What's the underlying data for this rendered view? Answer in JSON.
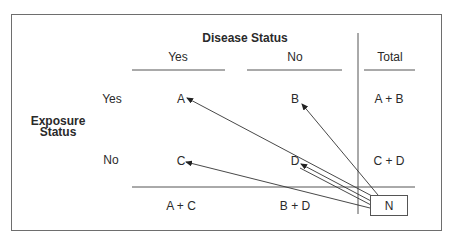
{
  "diagram": {
    "title": "Disease Status",
    "row_header": [
      "Exposure",
      "Status"
    ],
    "columns": [
      {
        "label": "Yes"
      },
      {
        "label": "No"
      },
      {
        "label": "Total"
      }
    ],
    "rows": [
      {
        "label": "Yes",
        "cells": [
          "A",
          "B",
          "A + B"
        ]
      },
      {
        "label": "No",
        "cells": [
          "C",
          "D",
          "C + D"
        ]
      }
    ],
    "totals_row": [
      "A + C",
      "B + D"
    ],
    "grand_total": "N",
    "arrows": [
      {
        "from": "N",
        "to": "A"
      },
      {
        "from": "N",
        "to": "B"
      },
      {
        "from": "N",
        "to": "C"
      },
      {
        "from": "N",
        "to": "D"
      }
    ],
    "colors": {
      "line": "#4a4a4a",
      "frame": "#6e6e6e",
      "text": "#2a2a2a"
    }
  }
}
